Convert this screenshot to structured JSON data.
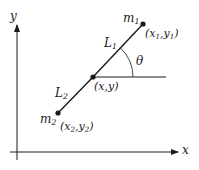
{
  "diagram": {
    "title": "",
    "colors": {
      "stroke": "#1a1a1a",
      "background": "#ffffff"
    },
    "axes": {
      "x_label": "x",
      "y_label": "y"
    },
    "nodes": [
      {
        "id": "m1",
        "mass_label": "m",
        "mass_sub": "1",
        "coord_label": "(x1,y1)",
        "coord_parts": [
          "(x",
          "1",
          ",y",
          "1",
          ")"
        ]
      },
      {
        "id": "center",
        "coord_label": "(x,y)"
      },
      {
        "id": "m2",
        "mass_label": "m",
        "mass_sub": "2",
        "coord_label": "(x2,y2)",
        "coord_parts": [
          "(x",
          "2",
          ",y",
          "2",
          ")"
        ]
      }
    ],
    "segments": [
      {
        "id": "L1",
        "label": "L",
        "sub": "1",
        "from": "center",
        "to": "m1"
      },
      {
        "id": "L2",
        "label": "L",
        "sub": "2",
        "from": "center",
        "to": "m2"
      }
    ],
    "angle": {
      "label": "θ",
      "between": [
        "horizontal-reference",
        "L1"
      ]
    }
  }
}
